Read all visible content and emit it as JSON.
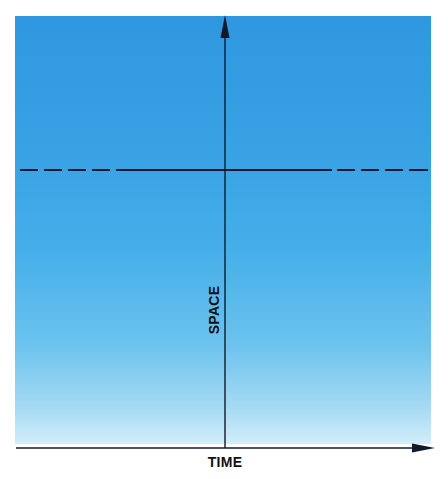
{
  "diagram": {
    "x_axis": {
      "label": "TIME",
      "direction": "right",
      "arrow": true
    },
    "y_axis": {
      "label": "SPACE",
      "direction": "up",
      "arrow": true,
      "label_orientation": "rotated-vertical"
    },
    "reference_line": {
      "orientation": "horizontal",
      "style": "dashed-solid-dashed",
      "description": "line of constant space position, solid in the middle and dashed toward both edges"
    },
    "background": {
      "type": "vertical-gradient",
      "colors": [
        "#2f97df",
        "#3aa3e5",
        "#46afea",
        "#6cc3ee",
        "#a8dbf4",
        "#d2eefa"
      ]
    },
    "line_color": "#111a2a"
  }
}
